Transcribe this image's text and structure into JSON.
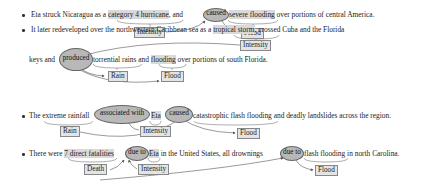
{
  "sentences": [
    {
      "pre": "Eta struck Nicaragua as a ",
      "arg1": "category 4 hurricane",
      "mid1": ", and",
      "trigger": "caused",
      "arg2": "severe flooding",
      "post": " over portions of central America.",
      "labels": [
        "Intensity",
        "Flood"
      ]
    },
    {
      "line1_pre": "It later redeveloped over the northwestern Caribbean sea as a ",
      "arg1": "tropical storm",
      "line1_post": ", crossed Cuba and the Florida",
      "line2_pre": "keys and",
      "trigger": "produced",
      "arg2": "torrential rains",
      "mid": " and ",
      "arg3": "flooding",
      "post": " over portions of south Florida.",
      "labels": [
        "Intensity",
        "Rain",
        "Flood"
      ]
    },
    {
      "pre": "The ",
      "arg1": "extreme rainfall",
      "trigger1": "associated with",
      "arg2": "Eta",
      "trigger2": "caused",
      "arg3": "catastrophic flash flooding",
      "post": " and deadly landslides across the region.",
      "labels": [
        "Rain",
        "Intensity",
        "Flood"
      ]
    },
    {
      "pre": "There were ",
      "arg1": "7 direct fatalities",
      "trigger1": "due to",
      "arg2": "Eta",
      "mid": " in the United States, all drownings",
      "trigger2": "due to",
      "arg3": "flash flooding",
      "post": " in north Carolina.",
      "labels": [
        "Death",
        "Intensity",
        "Flood"
      ]
    }
  ],
  "colors": {
    "trigger_fill": "#b8b8b8",
    "arg_highlight": "#d9d9d9",
    "label_fill": "#e4e4e4",
    "arrow": "#555555"
  }
}
